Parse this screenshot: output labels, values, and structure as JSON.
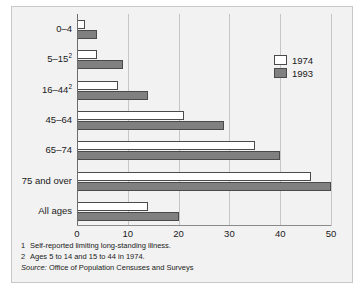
{
  "chart_data": {
    "type": "bar",
    "orientation": "horizontal",
    "title": "",
    "xlabel": "",
    "ylabel": "",
    "xlim": [
      0,
      50
    ],
    "xticks": [
      0,
      10,
      20,
      30,
      40,
      50
    ],
    "xtick_labels": [
      "0",
      "10",
      "20",
      "30",
      "40",
      "50"
    ],
    "grid": true,
    "grid_axis": "x",
    "legend_position": "upper right",
    "categories": [
      "0–4",
      "5–15",
      "16–44",
      "45–64",
      "65–74",
      "75 and over",
      "All ages"
    ],
    "category_footnote_markers": [
      "",
      "2",
      "2",
      "",
      "",
      "",
      ""
    ],
    "series": [
      {
        "name": "1974",
        "color": "#ffffff",
        "values": [
          1.5,
          4,
          8,
          21,
          35,
          46,
          14
        ]
      },
      {
        "name": "1993",
        "color": "#808080",
        "values": [
          4,
          9,
          14,
          29,
          40,
          50,
          20
        ]
      }
    ]
  },
  "legend": {
    "items": [
      {
        "label": "1974",
        "swatch": "white-swatch"
      },
      {
        "label": "1993",
        "swatch": "gray-swatch"
      }
    ]
  },
  "footnotes": [
    {
      "marker": "1",
      "text": "Self-reported limiting long-standing illness."
    },
    {
      "marker": "2",
      "text": "Ages 5 to 14 and 15 to 44 in 1974."
    }
  ],
  "source": {
    "label": "Source:",
    "text": "Office of Population Censuses and Surveys"
  },
  "colors": {
    "bar_1974": "#ffffff",
    "bar_1993": "#808080",
    "bar_outline": "#4a4a4a",
    "plot_background": "#f2f2f2",
    "gridline": "#c6c6c6",
    "axis": "#6d6d6d",
    "text": "#1a1a1a"
  }
}
